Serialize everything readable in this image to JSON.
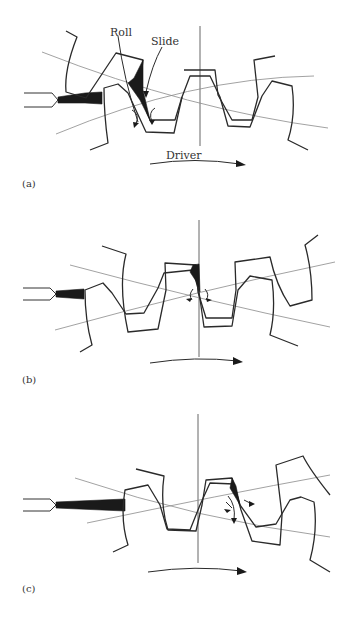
{
  "figure": {
    "panels": [
      {
        "id": "a",
        "label": "(a)",
        "annotations": {
          "roll": "Roll",
          "slide": "Slide",
          "driver": "Driver"
        }
      },
      {
        "id": "b",
        "label": "(b)"
      },
      {
        "id": "c",
        "label": "(c)"
      }
    ],
    "colors": {
      "line": "#2a2a2a",
      "pitch_circle": "#8a8a8a",
      "fill": "#1a1a1a",
      "background": "#ffffff"
    }
  }
}
